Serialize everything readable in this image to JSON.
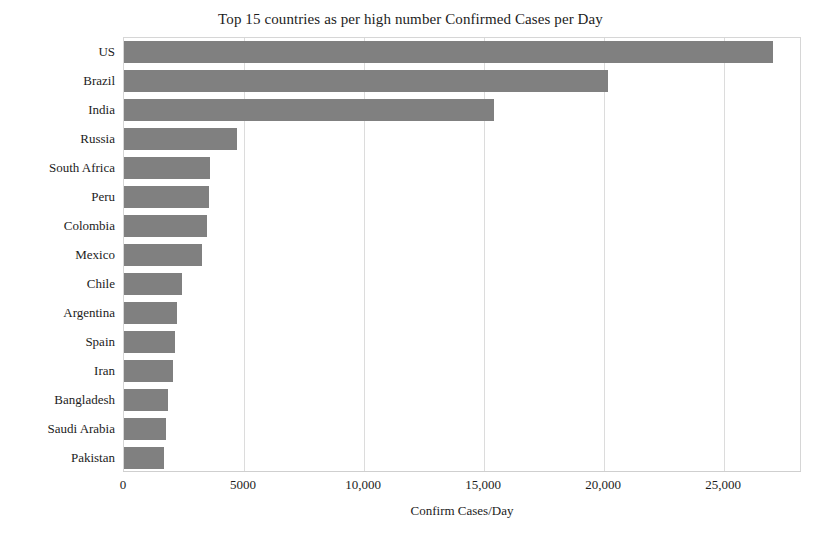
{
  "chart_data": {
    "type": "bar",
    "orientation": "horizontal",
    "title": "Top 15 countries as per high number Confirmed Cases per Day",
    "xlabel": "Confirm Cases/Day",
    "ylabel": "Country/Region",
    "categories": [
      "US",
      "Brazil",
      "India",
      "Russia",
      "South Africa",
      "Peru",
      "Colombia",
      "Mexico",
      "Chile",
      "Argentina",
      "Spain",
      "Iran",
      "Bangladesh",
      "Saudi Arabia",
      "Pakistan"
    ],
    "values": [
      27040,
      20170,
      15420,
      4700,
      3580,
      3540,
      3460,
      3250,
      2420,
      2210,
      2120,
      2040,
      1830,
      1750,
      1670
    ],
    "xlim": [
      0,
      28250
    ],
    "ylim_categories": 15,
    "xticks": [
      0,
      5000,
      10000,
      15000,
      20000,
      25000
    ],
    "xtick_labels": [
      "0",
      "5000",
      "10,000",
      "15,000",
      "20,000",
      "25,000"
    ],
    "grid": "vertical",
    "legend": "none",
    "bar_color": "#808080",
    "gridline_color": "#dcdcdc",
    "plot_border_color": "#d6d6d6",
    "background_color": "#ffffff"
  },
  "figure": {
    "title": "Top 15 countries as per high number Confirmed Cases per Day",
    "x_axis_title": "Confirm Cases/Day",
    "y_axis_title": "Country/Region"
  }
}
